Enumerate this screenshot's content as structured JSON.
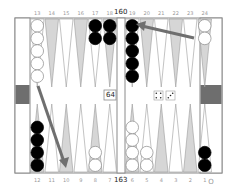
{
  "board": {
    "top_labels": [
      "13",
      "14",
      "15",
      "16",
      "17",
      "18",
      "19",
      "20",
      "21",
      "22",
      "23",
      "24"
    ],
    "bottom_labels": [
      "12",
      "11",
      "10",
      "9",
      "8",
      "7",
      "6",
      "5",
      "4",
      "3",
      "2",
      "1"
    ],
    "top_pip_count": "160",
    "bottom_pip_count": "163",
    "off_label": "O",
    "cube_value": "64",
    "dice": [
      4,
      3
    ],
    "colors": {
      "frame": "#8a8a8a",
      "light_point": "#d6d6d6",
      "dark_point": "#ffffff",
      "point_outline": "#9a9a9a",
      "bar_marker": "#6e6e6e",
      "arrow": "#6f6f6f",
      "black_checker": "#000000",
      "white_checker": "#ffffff"
    },
    "checkers": {
      "top": [
        {
          "point": 13,
          "color": "white",
          "count": 5
        },
        {
          "point": 17,
          "color": "black",
          "count": 2
        },
        {
          "point": 18,
          "color": "black",
          "count": 2
        },
        {
          "point": 19,
          "color": "black",
          "count": 5
        },
        {
          "point": 24,
          "color": "white",
          "count": 2
        }
      ],
      "bottom": [
        {
          "point": 12,
          "color": "black",
          "count": 4
        },
        {
          "point": 8,
          "color": "white",
          "count": 2
        },
        {
          "point": 6,
          "color": "white",
          "count": 4
        },
        {
          "point": 5,
          "color": "white",
          "count": 2
        },
        {
          "point": 1,
          "color": "black",
          "count": 2
        }
      ]
    },
    "moves": [
      {
        "from": "24",
        "to": "20"
      },
      {
        "from": "13",
        "to": "10"
      }
    ]
  }
}
